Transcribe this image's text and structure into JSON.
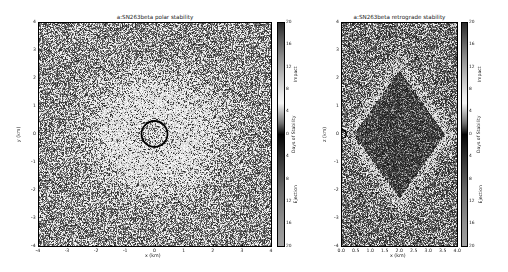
{
  "chart_data": [
    {
      "type": "heatmap",
      "title": "a:SN263beta polar stability",
      "xlabel": "x (km)",
      "ylabel": "y (km)",
      "xlim": [
        -4,
        4
      ],
      "ylim": [
        -4,
        4
      ],
      "xticks": [
        "-4",
        "-3",
        "-2",
        "-1",
        "0",
        "1",
        "2",
        "3",
        "4"
      ],
      "yticks": [
        "4",
        "3",
        "2",
        "1",
        "0",
        "-1",
        "-2",
        "-3",
        "-4"
      ],
      "body_outline": {
        "center": [
          0,
          0
        ],
        "radius_km": 0.5
      },
      "pattern": "noisy field with lighter (stable) halo around central body, approx. radius 2 km",
      "colorbar": {
        "ticks": [
          "20",
          "16",
          "12",
          "8",
          "4",
          "0",
          "4",
          "8",
          "12",
          "16",
          "20"
        ],
        "labels": {
          "top": "Impact",
          "middle": "Days of Stability",
          "bottom": "Ejection"
        },
        "range": [
          -20,
          20
        ]
      }
    },
    {
      "type": "heatmap",
      "title": "a:SN263beta retrograde stability",
      "xlabel": "x (km)",
      "ylabel": "z (km)",
      "xlim": [
        0,
        4
      ],
      "ylim": [
        -4,
        4
      ],
      "xticks": [
        "0.0",
        "0.5",
        "1.0",
        "1.5",
        "2.0",
        "2.5",
        "3.0",
        "3.5",
        "4.0"
      ],
      "yticks": [
        "4",
        "3",
        "2",
        "1",
        "0",
        "-1",
        "-2",
        "-3",
        "-4"
      ],
      "body_outline": {
        "center": [
          0,
          0
        ],
        "radius_km": 0.15
      },
      "pattern": "dark (stable) diamond-shaped region centered near x=2 km, z=0, lighter band around it",
      "colorbar": {
        "ticks": [
          "20",
          "16",
          "12",
          "8",
          "4",
          "0",
          "4",
          "8",
          "12",
          "16",
          "20"
        ],
        "labels": {
          "top": "Impact",
          "middle": "Days of Stability",
          "bottom": "Ejection"
        },
        "range": [
          -20,
          20
        ]
      }
    }
  ]
}
